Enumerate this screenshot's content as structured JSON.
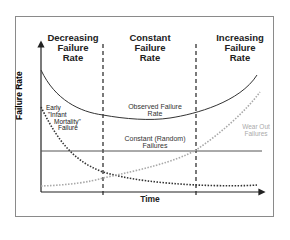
{
  "diagram": {
    "regions": [
      {
        "line1": "Decreasing",
        "line2": "Failure",
        "line3": "Rate"
      },
      {
        "line1": "Constant",
        "line2": "Failure",
        "line3": "Rate"
      },
      {
        "line1": "Increasing",
        "line2": "Failure",
        "line3": "Rate"
      }
    ],
    "y_axis_label": "Failure Rate",
    "x_axis_label": "Time",
    "curves": {
      "observed": {
        "line1": "Observed Failure",
        "line2": "Rate"
      },
      "constant": {
        "line1": "Constant (Random)",
        "line2": "Failures"
      },
      "early": {
        "line1": "Early",
        "line2": "\"Infant",
        "line3": "Mortality\"",
        "line4": "Failure"
      },
      "wearout": {
        "line1": "Wear Out",
        "line2": "Failures"
      }
    },
    "colors": {
      "observed": "#333333",
      "constant": "#555555",
      "early": "#333333",
      "wearout": "#a8a8a8",
      "frame": "#8a8a8a"
    }
  }
}
